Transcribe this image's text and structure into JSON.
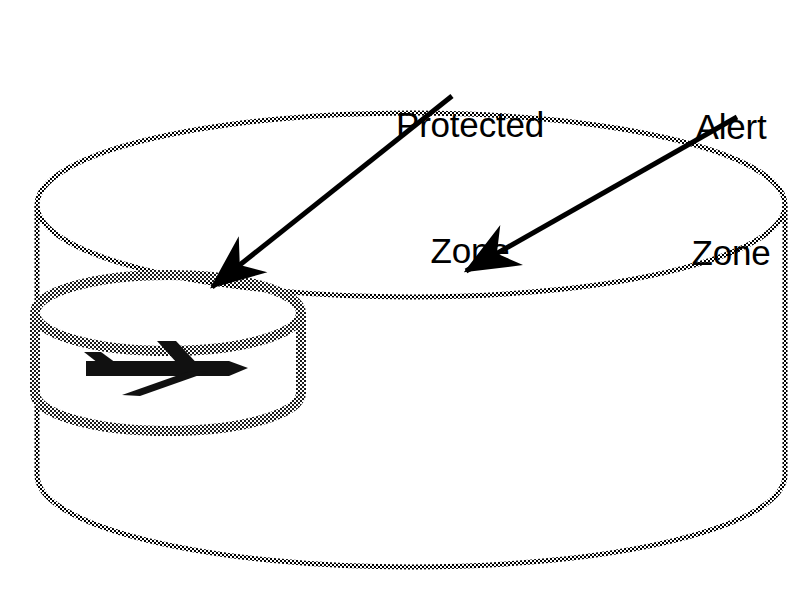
{
  "diagram": {
    "background_color": "#ffffff",
    "stroke_color": "#000000",
    "labels": {
      "protected_zone": "Protected\nZone",
      "protected_zone_line1": "Protected",
      "protected_zone_line2": "Zone",
      "alert_zone": "Alert\nZone",
      "alert_zone_line1": "Alert",
      "alert_zone_line2": "Zone"
    },
    "shapes": {
      "alert_zone_cylinder": {
        "name": "Alert Zone",
        "style": "stippled thin outline",
        "center_x": 411,
        "top_ellipse_cy": 205,
        "bottom_ellipse_cy": 475,
        "rx": 374,
        "ry": 92,
        "height": 270
      },
      "protected_zone_cylinder": {
        "name": "Protected Zone",
        "style": "stippled thick outline",
        "center_x": 168,
        "top_ellipse_cy": 313,
        "bottom_ellipse_cy": 393,
        "rx": 133,
        "ry": 38,
        "height": 80
      },
      "aircraft_symbol": {
        "name": "aircraft",
        "heading": "right",
        "fuselage_y": 368,
        "nose_x": 248,
        "tail_x": 84
      }
    },
    "annotations": [
      {
        "label": "Protected Zone",
        "arrow_from": [
          452,
          96
        ],
        "arrow_to": [
          205,
          293
        ]
      },
      {
        "label": "Alert Zone",
        "arrow_from": [
          737,
          117
        ],
        "arrow_to": [
          459,
          276
        ]
      }
    ]
  }
}
